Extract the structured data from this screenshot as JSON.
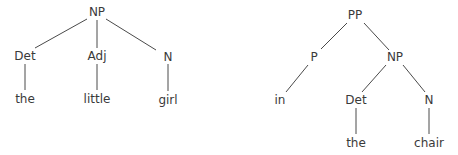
{
  "diagram": {
    "type": "syntax-trees",
    "trees": [
      {
        "name": "np-tree",
        "nodes": [
          {
            "id": "NP",
            "label": "NP",
            "x": 97,
            "y": 12
          },
          {
            "id": "Det",
            "label": "Det",
            "x": 25,
            "y": 56
          },
          {
            "id": "Adj",
            "label": "Adj",
            "x": 97,
            "y": 56
          },
          {
            "id": "N",
            "label": "N",
            "x": 168,
            "y": 57
          },
          {
            "id": "the",
            "label": "the",
            "x": 25,
            "y": 99
          },
          {
            "id": "little",
            "label": "little",
            "x": 97,
            "y": 99
          },
          {
            "id": "girl",
            "label": "girl",
            "x": 168,
            "y": 100
          }
        ],
        "edges": [
          {
            "from": "NP",
            "to": "Det",
            "x1": 87,
            "y1": 19,
            "x2": 35,
            "y2": 48
          },
          {
            "from": "NP",
            "to": "Adj",
            "x1": 97,
            "y1": 20,
            "x2": 97,
            "y2": 48
          },
          {
            "from": "NP",
            "to": "N",
            "x1": 106,
            "y1": 19,
            "x2": 156,
            "y2": 50
          },
          {
            "from": "Det",
            "to": "the",
            "x1": 25,
            "y1": 64,
            "x2": 25,
            "y2": 90
          },
          {
            "from": "Adj",
            "to": "little",
            "x1": 97,
            "y1": 64,
            "x2": 97,
            "y2": 90
          },
          {
            "from": "N",
            "to": "girl",
            "x1": 168,
            "y1": 64,
            "x2": 168,
            "y2": 91
          }
        ]
      },
      {
        "name": "pp-tree",
        "nodes": [
          {
            "id": "PP",
            "label": "PP",
            "x": 355,
            "y": 15
          },
          {
            "id": "P",
            "label": "P",
            "x": 314,
            "y": 57
          },
          {
            "id": "NP2",
            "label": "NP",
            "x": 395,
            "y": 57
          },
          {
            "id": "in",
            "label": "in",
            "x": 280,
            "y": 100
          },
          {
            "id": "Det2",
            "label": "Det",
            "x": 356,
            "y": 100
          },
          {
            "id": "N2",
            "label": "N",
            "x": 429,
            "y": 100
          },
          {
            "id": "the2",
            "label": "the",
            "x": 356,
            "y": 143
          },
          {
            "id": "chair",
            "label": "chair",
            "x": 429,
            "y": 143
          }
        ],
        "edges": [
          {
            "from": "PP",
            "to": "P",
            "x1": 347,
            "y1": 23,
            "x2": 321,
            "y2": 49
          },
          {
            "from": "PP",
            "to": "NP2",
            "x1": 364,
            "y1": 23,
            "x2": 389,
            "y2": 50
          },
          {
            "from": "P",
            "to": "in",
            "x1": 308,
            "y1": 65,
            "x2": 286,
            "y2": 92
          },
          {
            "from": "NP2",
            "to": "Det2",
            "x1": 386,
            "y1": 65,
            "x2": 362,
            "y2": 92
          },
          {
            "from": "NP2",
            "to": "N2",
            "x1": 403,
            "y1": 65,
            "x2": 425,
            "y2": 92
          },
          {
            "from": "Det2",
            "to": "the2",
            "x1": 356,
            "y1": 108,
            "x2": 356,
            "y2": 134
          },
          {
            "from": "N2",
            "to": "chair",
            "x1": 429,
            "y1": 108,
            "x2": 429,
            "y2": 134
          }
        ]
      }
    ]
  }
}
